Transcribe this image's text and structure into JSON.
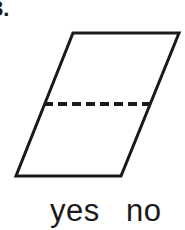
{
  "question": {
    "number_label": "3.",
    "prompt_visible": false
  },
  "figure": {
    "name": "parallelogram-with-dashed-midline",
    "shape_type": "parallelogram",
    "fill_color": "#ffffff",
    "stroke_color": "#1a1a1a",
    "stroke_width": 3,
    "vertices": [
      {
        "name": "top-left",
        "x": 73,
        "y": 33
      },
      {
        "name": "top-right",
        "x": 179,
        "y": 33
      },
      {
        "name": "bottom-right",
        "x": 121,
        "y": 176
      },
      {
        "name": "bottom-left",
        "x": 16,
        "y": 176
      }
    ],
    "dashed_line": {
      "name": "horizontal-dashed-midline",
      "x1": 44,
      "y1": 104,
      "x2": 150,
      "y2": 104,
      "dash_length": 9,
      "gap_length": 5,
      "stroke_width": 4,
      "stroke_color": "#1a1a1a"
    }
  },
  "answers": {
    "options": [
      {
        "id": "yes",
        "label": "yes"
      },
      {
        "id": "no",
        "label": "no"
      }
    ]
  }
}
